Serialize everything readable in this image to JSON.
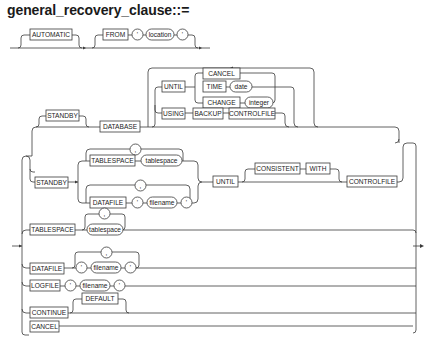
{
  "title": "general_recovery_clause::=",
  "diagram": {
    "top_row": {
      "automatic": "AUTOMATIC",
      "from": "FROM",
      "quote_open": "'",
      "location": "location",
      "quote_close": "'"
    },
    "database_branch": {
      "standby": "STANDBY",
      "database": "DATABASE",
      "until": "UNTIL",
      "cancel": "CANCEL",
      "time": "TIME",
      "date": "date",
      "change": "CHANGE",
      "integer": "integer",
      "using": "USING",
      "backup": "BACKUP",
      "controlfile": "CONTROLFILE"
    },
    "standby_branch": {
      "standby": "STANDBY",
      "tablespace": "TABLESPACE",
      "tablespace_var": "tablespace",
      "comma1": ",",
      "datafile": "DATAFILE",
      "quote_open": "'",
      "filename": "filename",
      "quote_close": "'",
      "comma2": ",",
      "until": "UNTIL",
      "consistent": "CONSISTENT",
      "with": "WITH",
      "controlfile": "CONTROLFILE"
    },
    "tablespace_branch": {
      "tablespace": "TABLESPACE",
      "comma": ",",
      "tablespace_var": "tablespace"
    },
    "datafile_branch": {
      "datafile": "DATAFILE",
      "comma": ",",
      "quote_open": "'",
      "filename": "filename",
      "quote_close": "'"
    },
    "logfile_branch": {
      "logfile": "LOGFILE",
      "quote_open": "'",
      "filename": "filename",
      "quote_close": "'"
    },
    "continue_branch": {
      "continue": "CONTINUE",
      "default": "DEFAULT"
    },
    "cancel_branch": {
      "cancel": "CANCEL"
    }
  },
  "colors": {
    "line": "#3a3a3a",
    "text": "#222222",
    "background": "#ffffff"
  }
}
